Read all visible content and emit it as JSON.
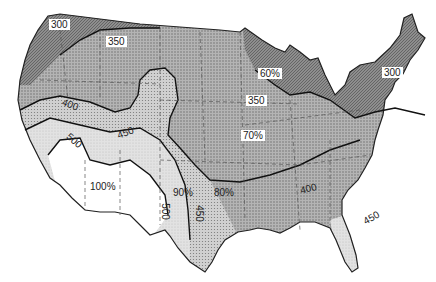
{
  "map": {
    "subject": "Contiguous United States contour map",
    "colors": {
      "background": "#ffffff",
      "zone_300_350": "#8c8c8c",
      "zone_350_400": "#a8a8a8",
      "zone_400_450": "#c4c4c4",
      "zone_450_500": "#dadada",
      "zone_500_plus": "#ffffff",
      "florida_zone": "#d6d6d6",
      "outline": "#222222",
      "state_borders": "#555555"
    },
    "contour_labels": [
      {
        "id": "c300-west",
        "text": "300"
      },
      {
        "id": "c350-west",
        "text": "350"
      },
      {
        "id": "c400-west",
        "text": "400"
      },
      {
        "id": "c450-west",
        "text": "450"
      },
      {
        "id": "c500-west",
        "text": "500"
      },
      {
        "id": "c500-texas",
        "text": "500"
      },
      {
        "id": "c450-texas",
        "text": "450"
      },
      {
        "id": "c350-midwest",
        "text": "350"
      },
      {
        "id": "c400-south",
        "text": "400"
      },
      {
        "id": "c300-northeast",
        "text": "300"
      },
      {
        "id": "c450-florida",
        "text": "450"
      }
    ],
    "percent_labels": [
      {
        "id": "p100",
        "text": "100%"
      },
      {
        "id": "p90",
        "text": "90%"
      },
      {
        "id": "p80",
        "text": "80%"
      },
      {
        "id": "p70",
        "text": "70%"
      },
      {
        "id": "p60",
        "text": "60%"
      }
    ]
  }
}
